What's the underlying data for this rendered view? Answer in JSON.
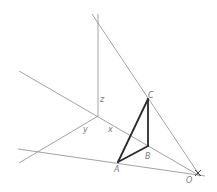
{
  "figure": {
    "labels": {
      "z": "z",
      "y": "y",
      "x": "x",
      "A": "A",
      "B": "B",
      "C": "C",
      "O": "O"
    },
    "colors": {
      "thin_line": "#8a8a8a",
      "bold_line": "#2a2a2a",
      "label": "#7a7a7a"
    }
  }
}
